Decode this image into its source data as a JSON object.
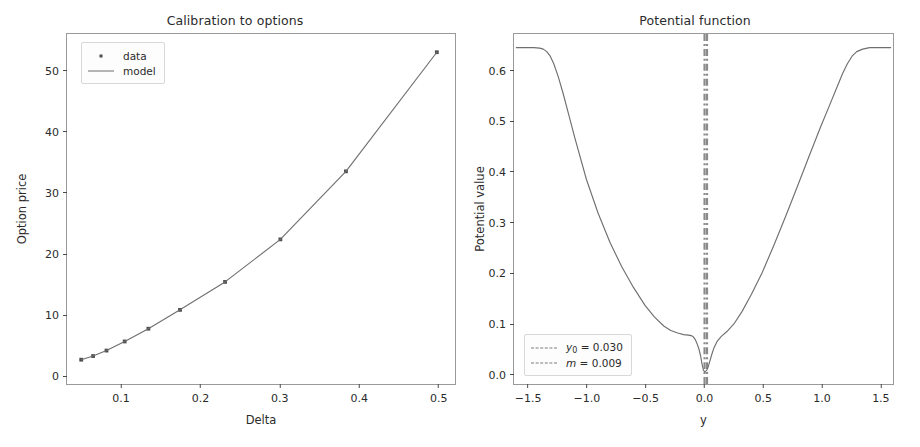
{
  "figure": {
    "background": "#ffffff",
    "line_color": "#6f6f6f",
    "marker_color": "#4d4d4d",
    "axis_color": "#9a9a9a",
    "vline_color": "#8a8a8a"
  },
  "panels": [
    {
      "id": "left",
      "title": "Calibration to options",
      "xlabel": "Delta",
      "ylabel": "Option price",
      "xticks": [
        "0.1",
        "0.2",
        "0.3",
        "0.4",
        "0.5"
      ],
      "yticks": [
        "0",
        "10",
        "20",
        "30",
        "40",
        "50"
      ],
      "legend": [
        {
          "label": "data",
          "key": "marker"
        },
        {
          "label": "model",
          "key": "line"
        }
      ]
    },
    {
      "id": "right",
      "title": "Potential function",
      "xlabel": "y",
      "ylabel": "Potential value",
      "xticks": [
        "-1.5",
        "-1.0",
        "-0.5",
        "0.0",
        "0.5",
        "1.0",
        "1.5"
      ],
      "yticks": [
        "0.0",
        "0.1",
        "0.2",
        "0.3",
        "0.4",
        "0.5",
        "0.6"
      ],
      "legend": [
        {
          "label_html": "<em>y</em><span class=\"sub\">0</span> = 0.030",
          "key": "dashdot"
        },
        {
          "label_html": "<em>m</em> = 0.009",
          "key": "dashdot"
        }
      ]
    }
  ],
  "chart_data": [
    {
      "type": "scatter",
      "id": "calibration-to-options",
      "title": "Calibration to options",
      "xlabel": "Delta",
      "ylabel": "Option price",
      "xlim": [
        0.032,
        0.523
      ],
      "ylim": [
        -1.6,
        56.0
      ],
      "xticks": [
        0.1,
        0.2,
        0.3,
        0.4,
        0.5
      ],
      "yticks": [
        0,
        10,
        20,
        30,
        40,
        50
      ],
      "grid": false,
      "legend_position": "upper left",
      "legend": [
        "data",
        "model"
      ],
      "series": [
        {
          "name": "data",
          "style": "markers",
          "x": [
            0.05,
            0.065,
            0.082,
            0.105,
            0.135,
            0.175,
            0.232,
            0.302,
            0.385,
            0.5
          ],
          "y": [
            2.4,
            3.0,
            3.9,
            5.4,
            7.5,
            10.6,
            15.2,
            22.2,
            33.4,
            53.0
          ]
        },
        {
          "name": "model",
          "style": "line",
          "x": [
            0.05,
            0.065,
            0.082,
            0.105,
            0.135,
            0.175,
            0.232,
            0.302,
            0.385,
            0.5
          ],
          "y": [
            2.4,
            3.0,
            3.9,
            5.4,
            7.5,
            10.6,
            15.2,
            22.2,
            33.4,
            53.0
          ]
        }
      ]
    },
    {
      "type": "line",
      "id": "potential-function",
      "title": "Potential function",
      "xlabel": "y",
      "ylabel": "Potential value",
      "xlim": [
        -1.62,
        1.62
      ],
      "ylim": [
        -0.022,
        0.672
      ],
      "xticks": [
        -1.5,
        -1.0,
        -0.5,
        0.0,
        0.5,
        1.0,
        1.5
      ],
      "yticks": [
        0.0,
        0.1,
        0.2,
        0.3,
        0.4,
        0.5,
        0.6
      ],
      "grid": false,
      "legend_position": "lower left",
      "annotations": [
        {
          "type": "vline",
          "label": "y0",
          "value": 0.03,
          "style": "dashdot"
        },
        {
          "type": "vline",
          "label": "m",
          "value": 0.009,
          "style": "dashdot"
        }
      ],
      "series": [
        {
          "name": "potential",
          "style": "line",
          "x": [
            -1.6,
            -1.55,
            -1.5,
            -1.45,
            -1.4,
            -1.37,
            -1.34,
            -1.31,
            -1.28,
            -1.24,
            -1.2,
            -1.15,
            -1.1,
            -1.0,
            -0.9,
            -0.8,
            -0.7,
            -0.6,
            -0.5,
            -0.42,
            -0.34,
            -0.28,
            -0.22,
            -0.17,
            -0.13,
            -0.105,
            -0.085,
            -0.07,
            -0.055,
            -0.04,
            -0.025,
            -0.012,
            0.0,
            0.012,
            0.022,
            0.03,
            0.04,
            0.055,
            0.07,
            0.09,
            0.115,
            0.15,
            0.2,
            0.26,
            0.33,
            0.41,
            0.5,
            0.6,
            0.7,
            0.8,
            0.9,
            1.0,
            1.08,
            1.14,
            1.19,
            1.23,
            1.27,
            1.31,
            1.36,
            1.42,
            1.5,
            1.56,
            1.6
          ],
          "y": [
            0.645,
            0.645,
            0.645,
            0.645,
            0.644,
            0.642,
            0.637,
            0.628,
            0.613,
            0.586,
            0.554,
            0.51,
            0.466,
            0.383,
            0.316,
            0.259,
            0.211,
            0.17,
            0.134,
            0.111,
            0.093,
            0.084,
            0.079,
            0.076,
            0.075,
            0.074,
            0.071,
            0.066,
            0.058,
            0.048,
            0.034,
            0.017,
            0.005,
            0.002,
            0.004,
            0.006,
            0.012,
            0.024,
            0.036,
            0.05,
            0.062,
            0.072,
            0.082,
            0.097,
            0.122,
            0.156,
            0.198,
            0.252,
            0.309,
            0.368,
            0.428,
            0.487,
            0.532,
            0.566,
            0.594,
            0.613,
            0.628,
            0.637,
            0.642,
            0.645,
            0.645,
            0.645,
            0.645
          ]
        }
      ]
    }
  ]
}
